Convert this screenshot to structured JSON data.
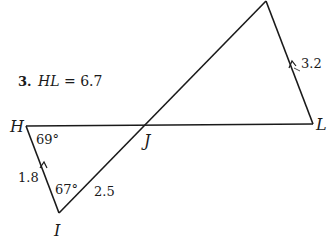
{
  "problem": {
    "number": "3.",
    "given": "HL = 6.7",
    "given_var": "HL",
    "given_eq": " = 6.7"
  },
  "vertices": {
    "H": "H",
    "I": "I",
    "J": "J",
    "L": "L"
  },
  "angles": {
    "H": "69°",
    "I": "67°"
  },
  "sides": {
    "HI": "1.8",
    "IJ": "2.5",
    "KL": "3.2"
  },
  "colors": {
    "line": "#1a1a1a",
    "background": "#ffffff"
  }
}
